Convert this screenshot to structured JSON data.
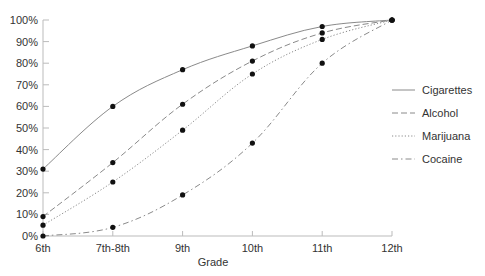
{
  "chart_data": {
    "type": "line",
    "title": "",
    "xlabel": "Grade",
    "ylabel": "",
    "categories": [
      "6th",
      "7th-8th",
      "9th",
      "10th",
      "11th",
      "12th"
    ],
    "y_ticks": [
      "0%",
      "10%",
      "20%",
      "30%",
      "40%",
      "50%",
      "60%",
      "70%",
      "80%",
      "90%",
      "100%"
    ],
    "ylim": [
      0,
      100
    ],
    "grid": false,
    "legend_position": "right",
    "series": [
      {
        "name": "Cigarettes",
        "style": "solid",
        "values": [
          31,
          60,
          77,
          88,
          97,
          100
        ]
      },
      {
        "name": "Alcohol",
        "style": "dashed",
        "values": [
          9,
          34,
          61,
          81,
          94,
          100
        ]
      },
      {
        "name": "Marijuana",
        "style": "dotted",
        "values": [
          5,
          25,
          49,
          75,
          91,
          100
        ]
      },
      {
        "name": "Cocaine",
        "style": "dashdot",
        "values": [
          0,
          4,
          19,
          43,
          80,
          100
        ]
      }
    ],
    "colors": {
      "line": "#8a8a8a",
      "marker": "#111111",
      "axis": "#bbbbbb",
      "text": "#333333"
    }
  }
}
